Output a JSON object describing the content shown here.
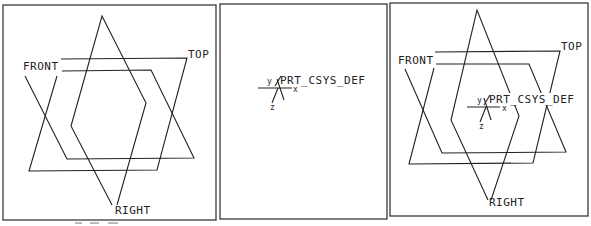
{
  "figure": {
    "panels": [
      {
        "name": "datum-planes",
        "frame": [
          3,
          5,
          213,
          215
        ],
        "labels": {
          "front": "FRONT",
          "top": "TOP",
          "right": "RIGHT"
        }
      },
      {
        "name": "coordinate-system",
        "frame": [
          220,
          4,
          167,
          215
        ],
        "labels": {
          "csys": "PRT_CSYS_DEF",
          "y": "y",
          "x": "x",
          "z": "z"
        }
      },
      {
        "name": "planes-and-csys",
        "frame": [
          390,
          3,
          198,
          213
        ],
        "labels": {
          "front": "FRONT",
          "top": "TOP",
          "right": "RIGHT",
          "csys": "PRT_CSYS_DEF",
          "y": "y",
          "x": "x",
          "z": "z"
        }
      }
    ]
  }
}
